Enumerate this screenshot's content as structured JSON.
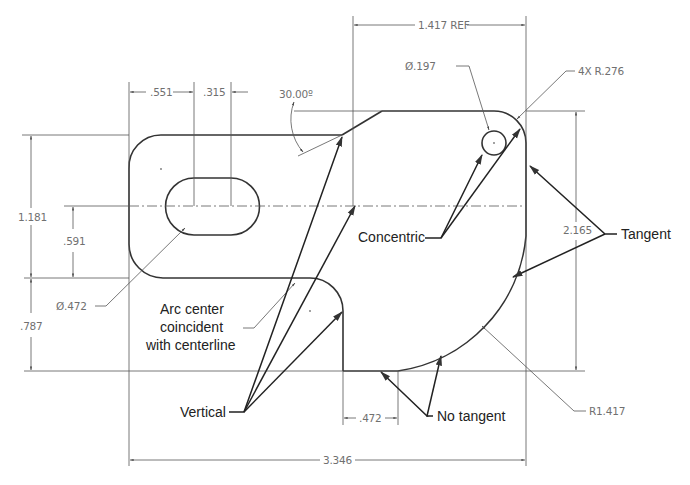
{
  "drawing": {
    "type": "sketch-constraints-diagram",
    "dimensions": {
      "top_ref": "1.417 REF",
      "slot_offset": ".551",
      "slot_width": ".315",
      "angle": "30.00º",
      "hole_diameter": "Ø.197",
      "corner_radius": "4X R.276",
      "left_height": "1.181",
      "centerline_height": ".591",
      "slot_diameter": "Ø.472",
      "lower_height": ".787",
      "right_height": "2.165",
      "big_radius": "R1.417",
      "bottom_step": ".472",
      "overall_width": "3.346"
    },
    "callouts": {
      "concentric": "Concentric",
      "tangent": "Tangent",
      "arc_center_line1": "Arc center",
      "arc_center_line2": "coincident",
      "arc_center_line3": "with centerline",
      "vertical": "Vertical",
      "no_tangent": "No tangent"
    },
    "colors": {
      "geometry": "#333333",
      "dimension_text": "#707070",
      "callout_text": "#222222",
      "background": "#ffffff"
    }
  }
}
